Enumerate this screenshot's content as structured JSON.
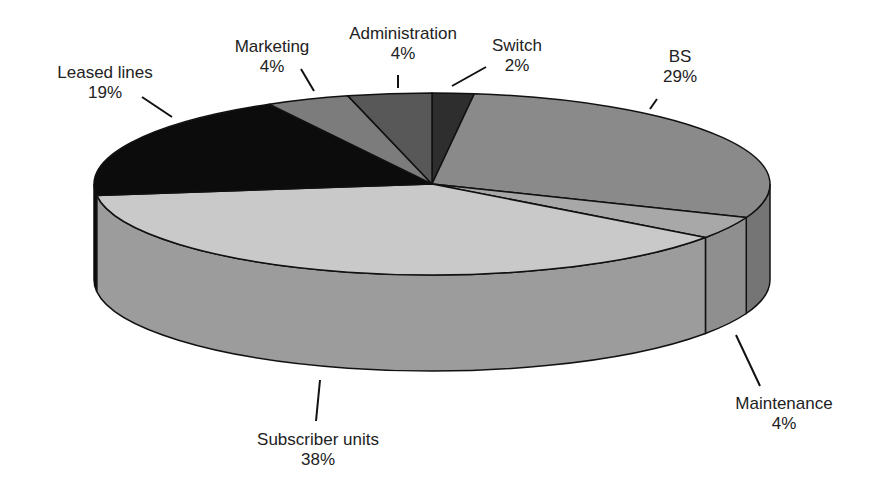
{
  "chart_data": {
    "type": "pie",
    "style": "3d",
    "title": "",
    "start_angle": "12 o'clock, clockwise",
    "slices": [
      {
        "label": "Switch",
        "value": 2,
        "display": "2%",
        "color": "#2e2e2e"
      },
      {
        "label": "BS",
        "value": 29,
        "display": "29%",
        "color": "#8a8a8a"
      },
      {
        "label": "Maintenance",
        "value": 4,
        "display": "4%",
        "color": "#a8a8a8"
      },
      {
        "label": "Subscriber units",
        "value": 38,
        "display": "38%",
        "color": "#c9c9c9"
      },
      {
        "label": "Leased lines",
        "value": 19,
        "display": "19%",
        "color": "#0c0c0c"
      },
      {
        "label": "Marketing",
        "value": 4,
        "display": "4%",
        "color": "#7c7c7c"
      },
      {
        "label": "Administration",
        "value": 4,
        "display": "4%",
        "color": "#585858"
      }
    ],
    "legend": "none (direct labels with leader lines)"
  },
  "labels": {
    "switch": {
      "name": "Switch",
      "pct": "2%"
    },
    "bs": {
      "name": "BS",
      "pct": "29%"
    },
    "maintenance": {
      "name": "Maintenance",
      "pct": "4%"
    },
    "subscriber": {
      "name": "Subscriber units",
      "pct": "38%"
    },
    "leased": {
      "name": "Leased lines",
      "pct": "19%"
    },
    "marketing": {
      "name": "Marketing",
      "pct": "4%"
    },
    "administration": {
      "name": "Administration",
      "pct": "4%"
    }
  }
}
